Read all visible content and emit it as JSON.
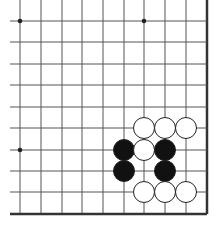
{
  "diagram": {
    "type": "go-board-fragment",
    "grid": {
      "columns_x": [
        20,
        41,
        62,
        82,
        103,
        124,
        144,
        165,
        186,
        207
      ],
      "rows_y": [
        21,
        42,
        64,
        85,
        107,
        128,
        150,
        171,
        192,
        214
      ],
      "left_extent": 10,
      "top_extent": 0,
      "right_edge": 207,
      "bottom_edge": 214,
      "line_color": "#555555",
      "edge_color": "#333333"
    },
    "star_points": [
      {
        "col": 0,
        "row": 0
      },
      {
        "col": 6,
        "row": 0
      },
      {
        "col": 0,
        "row": 6
      }
    ],
    "stones": [
      {
        "color": "white",
        "col": 6,
        "row": 5
      },
      {
        "color": "white",
        "col": 7,
        "row": 5
      },
      {
        "color": "white",
        "col": 8,
        "row": 5
      },
      {
        "color": "black",
        "col": 5,
        "row": 6
      },
      {
        "color": "white",
        "col": 6,
        "row": 6
      },
      {
        "color": "black",
        "col": 7,
        "row": 6
      },
      {
        "color": "black",
        "col": 5,
        "row": 7
      },
      {
        "color": "black",
        "col": 7,
        "row": 7
      },
      {
        "color": "white",
        "col": 6,
        "row": 8
      },
      {
        "color": "white",
        "col": 7,
        "row": 8
      },
      {
        "color": "white",
        "col": 8,
        "row": 8
      }
    ],
    "stone_radius": 10.5
  }
}
